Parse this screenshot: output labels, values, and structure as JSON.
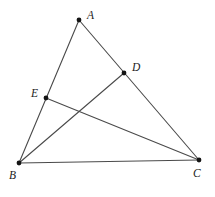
{
  "diagram": {
    "background": "#ffffff",
    "line_color": "#4a4a4a",
    "line_width": 1.1,
    "point_color": "#141414",
    "point_radius": 2.4,
    "label_color": "#222222",
    "points": {
      "A": {
        "label": "A",
        "x": 79,
        "y": 20,
        "label_x": 87,
        "label_y": 19
      },
      "B": {
        "label": "B",
        "x": 19,
        "y": 163,
        "label_x": 9,
        "label_y": 179
      },
      "C": {
        "label": "C",
        "x": 199,
        "y": 160,
        "label_x": 193,
        "label_y": 177
      },
      "D": {
        "label": "D",
        "x": 124,
        "y": 73,
        "label_x": 132,
        "label_y": 71
      },
      "E": {
        "label": "E",
        "x": 46,
        "y": 98,
        "label_x": 31,
        "label_y": 97
      }
    },
    "segments": [
      {
        "from": "A",
        "to": "B",
        "name": "side-AB"
      },
      {
        "from": "A",
        "to": "C",
        "name": "side-AC"
      },
      {
        "from": "B",
        "to": "C",
        "name": "side-BC"
      },
      {
        "from": "B",
        "to": "D",
        "name": "cevian-BD"
      },
      {
        "from": "C",
        "to": "E",
        "name": "cevian-CE"
      }
    ]
  }
}
